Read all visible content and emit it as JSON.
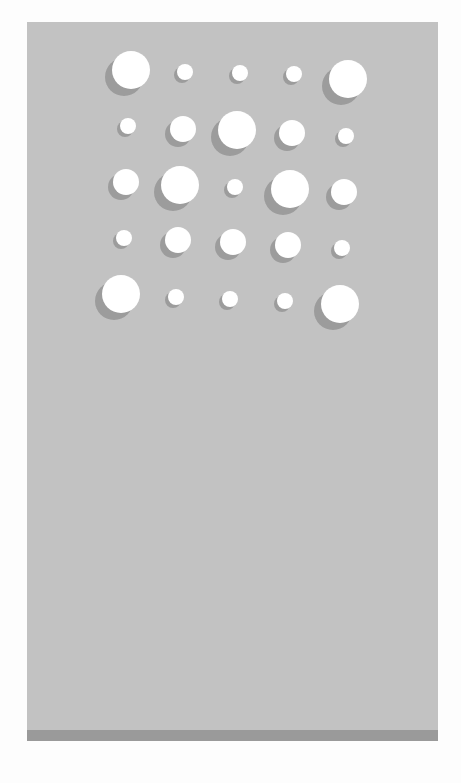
{
  "image": {
    "description": "Gray panel with a 5x5 grid of white circles of varying sizes casting lower-left shadows",
    "colors": {
      "page": "#fdfdfd",
      "panel": "#c2c2c2",
      "band": "#9a9a9a",
      "dot": "#ffffff",
      "shadow": "#8f8f8f"
    },
    "dots": [
      {
        "x": 131,
        "y": 70,
        "r": 19
      },
      {
        "x": 185,
        "y": 72,
        "r": 8
      },
      {
        "x": 240,
        "y": 73,
        "r": 8
      },
      {
        "x": 294,
        "y": 74,
        "r": 8
      },
      {
        "x": 348,
        "y": 79,
        "r": 19
      },
      {
        "x": 128,
        "y": 126,
        "r": 8
      },
      {
        "x": 183,
        "y": 129,
        "r": 13
      },
      {
        "x": 237,
        "y": 130,
        "r": 19
      },
      {
        "x": 292,
        "y": 133,
        "r": 13
      },
      {
        "x": 346,
        "y": 136,
        "r": 8
      },
      {
        "x": 126,
        "y": 182,
        "r": 13
      },
      {
        "x": 180,
        "y": 185,
        "r": 19
      },
      {
        "x": 235,
        "y": 187,
        "r": 8
      },
      {
        "x": 290,
        "y": 189,
        "r": 19
      },
      {
        "x": 344,
        "y": 192,
        "r": 13
      },
      {
        "x": 124,
        "y": 238,
        "r": 8
      },
      {
        "x": 178,
        "y": 240,
        "r": 13
      },
      {
        "x": 233,
        "y": 242,
        "r": 13
      },
      {
        "x": 288,
        "y": 245,
        "r": 13
      },
      {
        "x": 342,
        "y": 248,
        "r": 8
      },
      {
        "x": 121,
        "y": 294,
        "r": 19
      },
      {
        "x": 176,
        "y": 297,
        "r": 8
      },
      {
        "x": 230,
        "y": 299,
        "r": 8
      },
      {
        "x": 285,
        "y": 301,
        "r": 8
      },
      {
        "x": 340,
        "y": 304,
        "r": 19
      }
    ]
  }
}
